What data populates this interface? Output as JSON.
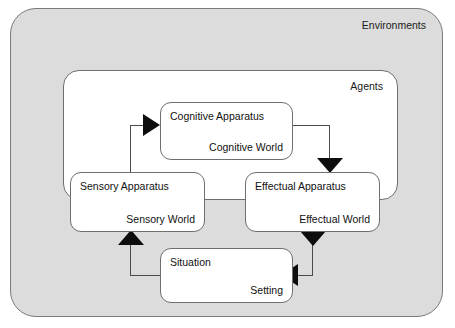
{
  "diagram": {
    "outer_container": {
      "label": "Environments",
      "fill": "#dcdcdc",
      "stroke": "#7b7b7b"
    },
    "inner_container": {
      "label": "Agents",
      "fill": "#ffffff",
      "stroke": "#6f6f6f"
    },
    "nodes": [
      {
        "id": "cognitive",
        "title": "Cognitive Apparatus",
        "subtitle": "Cognitive World"
      },
      {
        "id": "sensory",
        "title": "Sensory Apparatus",
        "subtitle": "Sensory World"
      },
      {
        "id": "effectual",
        "title": "Effectual Apparatus",
        "subtitle": "Effectual World"
      },
      {
        "id": "situation",
        "title": "Situation",
        "subtitle": "Setting"
      }
    ],
    "connectors": [
      {
        "id": "sensory-to-cognitive",
        "from": "sensory",
        "to": "cognitive",
        "head": "right"
      },
      {
        "id": "cognitive-to-effectual",
        "from": "cognitive",
        "to": "effectual",
        "head": "down"
      },
      {
        "id": "effectual-to-situation",
        "from": "effectual",
        "to": "situation",
        "head": "left"
      },
      {
        "id": "situation-to-sensory",
        "from": "situation",
        "to": "sensory",
        "head": "up"
      }
    ],
    "colors": {
      "arrow": "#0d0d0d",
      "line": "#4a4a4a",
      "text": "#111111"
    }
  }
}
